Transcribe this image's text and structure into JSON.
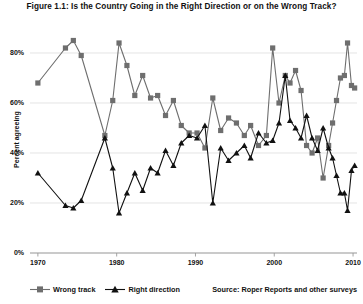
{
  "figure": {
    "title": "Figure 1.1: Is the Country Going in the Right Direction or on the Wrong Track?",
    "source": "Source: Roper Reports and other surveys"
  },
  "axes": {
    "ylabel": "Percent agreeing",
    "yticks": [
      "0%",
      "20%",
      "40%",
      "60%",
      "80%"
    ],
    "xticks": [
      "1970",
      "1980",
      "1990",
      "2000",
      "2010"
    ]
  },
  "legend": {
    "items": [
      {
        "label": "Wrong track",
        "marker": "square",
        "color": "#6e6e6e"
      },
      {
        "label": "Right direction",
        "marker": "triangle",
        "color": "#111111"
      }
    ]
  },
  "colors": {
    "wrong_track": "#6e6e6e",
    "right_direction": "#111111",
    "grid": "#d8d8d8",
    "axis": "#9a9a9a",
    "background": "#ffffff"
  },
  "chart_data": {
    "type": "line",
    "title": "Figure 1.1: Is the Country Going in the Right Direction or on the Wrong Track?",
    "xlabel": "",
    "ylabel": "Percent agreeing",
    "xlim": [
      1969,
      2010.5
    ],
    "ylim": [
      0,
      88
    ],
    "yticks": [
      0,
      20,
      40,
      60,
      80
    ],
    "xticks": [
      1970,
      1980,
      1990,
      2000,
      2010
    ],
    "grid": "horizontal",
    "legend_position": "bottom-left",
    "series": [
      {
        "name": "Wrong track",
        "marker": "square",
        "color": "#6e6e6e",
        "points": [
          [
            1970.0,
            68
          ],
          [
            1973.5,
            82
          ],
          [
            1974.5,
            85
          ],
          [
            1975.5,
            79
          ],
          [
            1978.5,
            47
          ],
          [
            1979.5,
            61
          ],
          [
            1980.3,
            84
          ],
          [
            1981.3,
            75
          ],
          [
            1982.3,
            63
          ],
          [
            1983.3,
            71
          ],
          [
            1984.3,
            62
          ],
          [
            1985.2,
            63
          ],
          [
            1986.2,
            55
          ],
          [
            1987.2,
            61
          ],
          [
            1988.2,
            51
          ],
          [
            1989.2,
            48
          ],
          [
            1990.2,
            48
          ],
          [
            1991.2,
            42
          ],
          [
            1992.2,
            62
          ],
          [
            1993.2,
            49
          ],
          [
            1994.2,
            54
          ],
          [
            1995.2,
            52
          ],
          [
            1996.2,
            47
          ],
          [
            1997.0,
            51
          ],
          [
            1998.0,
            43
          ],
          [
            1999.0,
            47
          ],
          [
            1999.8,
            82
          ],
          [
            2000.6,
            60
          ],
          [
            2001.4,
            71
          ],
          [
            2002.0,
            68
          ],
          [
            2002.7,
            73
          ],
          [
            2003.4,
            65
          ],
          [
            2004.1,
            43
          ],
          [
            2004.8,
            40
          ],
          [
            2005.5,
            46
          ],
          [
            2006.2,
            30
          ],
          [
            2006.9,
            43
          ],
          [
            2007.4,
            52
          ],
          [
            2007.9,
            61
          ],
          [
            2008.4,
            70
          ],
          [
            2008.9,
            71
          ],
          [
            2009.3,
            84
          ],
          [
            2009.8,
            67
          ],
          [
            2010.2,
            66
          ]
        ]
      },
      {
        "name": "Right direction",
        "marker": "triangle",
        "color": "#111111",
        "points": [
          [
            1970.0,
            32
          ],
          [
            1973.5,
            19
          ],
          [
            1974.5,
            18
          ],
          [
            1975.5,
            21
          ],
          [
            1978.5,
            46
          ],
          [
            1979.5,
            34
          ],
          [
            1980.3,
            16
          ],
          [
            1981.3,
            24
          ],
          [
            1982.3,
            32
          ],
          [
            1983.3,
            25
          ],
          [
            1984.3,
            34
          ],
          [
            1985.2,
            32
          ],
          [
            1986.2,
            41
          ],
          [
            1987.2,
            35
          ],
          [
            1988.2,
            44
          ],
          [
            1989.2,
            47
          ],
          [
            1990.2,
            46
          ],
          [
            1991.2,
            51
          ],
          [
            1992.2,
            20
          ],
          [
            1993.2,
            42
          ],
          [
            1994.2,
            37
          ],
          [
            1995.2,
            40
          ],
          [
            1996.2,
            43
          ],
          [
            1997.0,
            38
          ],
          [
            1998.0,
            48
          ],
          [
            1999.0,
            44
          ],
          [
            1999.8,
            45
          ],
          [
            2000.6,
            52
          ],
          [
            2001.4,
            71
          ],
          [
            2002.0,
            53
          ],
          [
            2002.7,
            50
          ],
          [
            2003.4,
            46
          ],
          [
            2004.1,
            55
          ],
          [
            2004.8,
            46
          ],
          [
            2005.5,
            41
          ],
          [
            2006.2,
            50
          ],
          [
            2006.9,
            42
          ],
          [
            2007.4,
            38
          ],
          [
            2007.9,
            31
          ],
          [
            2008.4,
            24
          ],
          [
            2008.9,
            24
          ],
          [
            2009.3,
            17
          ],
          [
            2009.8,
            33
          ],
          [
            2010.2,
            35
          ]
        ]
      }
    ]
  }
}
